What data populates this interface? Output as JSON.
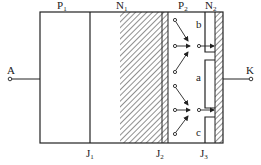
{
  "diagram": {
    "type": "thyristor-structure",
    "regions": [
      {
        "id": "P1",
        "label": "P",
        "sub": "1"
      },
      {
        "id": "N1",
        "label": "N",
        "sub": "1"
      },
      {
        "id": "P2",
        "label": "P",
        "sub": "2"
      },
      {
        "id": "N2",
        "label": "N",
        "sub": "2"
      }
    ],
    "junctions": [
      {
        "id": "J1",
        "label": "J",
        "sub": "1"
      },
      {
        "id": "J2",
        "label": "J",
        "sub": "2"
      },
      {
        "id": "J3",
        "label": "J",
        "sub": "3"
      }
    ],
    "terminals": {
      "anode": "A",
      "cathode": "K"
    },
    "n2_segments": {
      "top": "b",
      "middle": "a",
      "bottom": "c"
    },
    "colors": {
      "line": "#222222",
      "background": "#ffffff"
    }
  }
}
